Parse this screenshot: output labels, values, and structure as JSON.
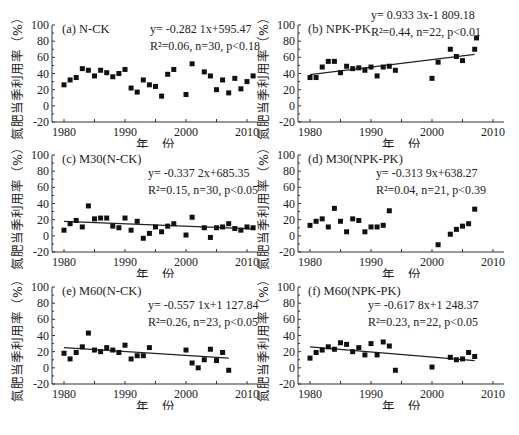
{
  "figure": {
    "ylabel": "氮肥当季利用率（%）",
    "xlabel": "年　份",
    "xticks": [
      "1980",
      "1990",
      "2000",
      "2010"
    ],
    "yticks": [
      "100",
      "80",
      "60",
      "40",
      "20",
      "0",
      "-20"
    ]
  },
  "chart_data": [
    {
      "type": "scatter",
      "title": "(a) N-CK",
      "equation": "y= -0.282 1x+595.47",
      "stats": "R²=0.06, n=30, p<0.18",
      "xlabel": "年 份",
      "ylabel": "氮肥当季利用率（%）",
      "xlim": [
        1979,
        2011
      ],
      "ylim": [
        -20,
        100
      ],
      "trendline": false,
      "x": [
        1980,
        1981,
        1982,
        1983,
        1984,
        1985,
        1986,
        1987,
        1988,
        1989,
        1990,
        1991,
        1992,
        1993,
        1994,
        1995,
        1996,
        1997,
        1998,
        2000,
        2001,
        2003,
        2004,
        2005,
        2006,
        2007,
        2008,
        2009,
        2010,
        2011
      ],
      "y": [
        26,
        32,
        35,
        46,
        44,
        37,
        44,
        41,
        36,
        40,
        45,
        22,
        17,
        32,
        26,
        24,
        12,
        39,
        45,
        14,
        52,
        42,
        37,
        20,
        32,
        16,
        34,
        21,
        30,
        37
      ]
    },
    {
      "type": "scatter",
      "title": "(b) NPK-PK",
      "equation": "y= 0.933 3x-1 809.18",
      "stats": "R²=0.44, n=22, p<0.01",
      "xlabel": "年 份",
      "ylabel": "氮肥当季利用率（%）",
      "xlim": [
        1979,
        2011
      ],
      "ylim": [
        -20,
        100
      ],
      "trendline": true,
      "trend": {
        "x0": 1980,
        "y0": 38.5,
        "x1": 2007,
        "y1": 63.7
      },
      "x": [
        1980,
        1981,
        1982,
        1983,
        1984,
        1985,
        1986,
        1987,
        1988,
        1989,
        1990,
        1991,
        1992,
        1993,
        1994,
        2000,
        2001,
        2003,
        2004,
        2005,
        2007,
        2007.3
      ],
      "y": [
        35,
        35,
        48,
        55,
        55,
        41,
        49,
        46,
        47,
        44,
        48,
        37,
        48,
        49,
        44,
        34,
        54,
        70,
        61,
        56,
        70,
        84
      ]
    },
    {
      "type": "scatter",
      "title": "(c) M30(N-CK)",
      "equation": "y= -0.337 2x+685.35",
      "stats": "R²=0.15, n=30, p<0.05",
      "xlabel": "年 份",
      "ylabel": "氮肥当季利用率（%）",
      "xlim": [
        1979,
        2011
      ],
      "ylim": [
        -20,
        100
      ],
      "trendline": true,
      "trend": {
        "x0": 1980,
        "y0": 18,
        "x1": 2011,
        "y1": 8.5
      },
      "x": [
        1980,
        1981,
        1982,
        1983,
        1984,
        1985,
        1986,
        1987,
        1988,
        1989,
        1990,
        1991,
        1992,
        1993,
        1994,
        1995,
        1996,
        1997,
        1998,
        2000,
        2001,
        2003,
        2004,
        2005,
        2006,
        2007,
        2008,
        2009,
        2010,
        2011
      ],
      "y": [
        7,
        15,
        19,
        11,
        37,
        21,
        22,
        22,
        12,
        10,
        22,
        7,
        18,
        -3,
        3,
        11,
        5,
        12,
        15,
        1,
        23,
        10,
        -2,
        10,
        11,
        15,
        9,
        7,
        11,
        10
      ]
    },
    {
      "type": "scatter",
      "title": "(d) M30(NPK-PK)",
      "equation": "y= -0.313 9x+638.27",
      "stats": "R²=0.04, n=21, p<0.39",
      "xlabel": "年 份",
      "ylabel": "氮肥当季利用率（%）",
      "xlim": [
        1979,
        2011
      ],
      "ylim": [
        -20,
        100
      ],
      "trendline": false,
      "x": [
        1980,
        1981,
        1982,
        1983,
        1984,
        1985,
        1986,
        1987,
        1988,
        1989,
        1990,
        1991,
        1992,
        1993,
        2001,
        2003,
        2004,
        2005,
        2006,
        2007
      ],
      "y": [
        13,
        18,
        21,
        11,
        34,
        18,
        5,
        21,
        19,
        5,
        11,
        11,
        13,
        31,
        -11,
        2,
        8,
        12,
        15,
        33
      ]
    },
    {
      "type": "scatter",
      "title": "(e) M60(N-CK)",
      "equation": "y= -0.557 1x+1 127.84",
      "stats": "R²=0.26, n=23, p<0.05",
      "xlabel": "年 份",
      "ylabel": "氮肥当季利用率（%）",
      "xlim": [
        1979,
        2011
      ],
      "ylim": [
        -20,
        100
      ],
      "trendline": true,
      "trend": {
        "x0": 1980,
        "y0": 25,
        "x1": 2007,
        "y1": 12
      },
      "x": [
        1980,
        1981,
        1982,
        1983,
        1984,
        1985,
        1986,
        1987,
        1988,
        1989,
        1990,
        1991,
        1992,
        1993,
        1994,
        2000,
        2001,
        2002,
        2003,
        2004,
        2005,
        2006,
        2007
      ],
      "y": [
        18,
        11,
        19,
        26,
        43,
        22,
        20,
        25,
        22,
        19,
        28,
        11,
        15,
        15,
        25,
        22,
        6,
        0,
        10,
        23,
        9,
        19,
        -3
      ]
    },
    {
      "type": "scatter",
      "title": "(f) M60(NPK-PK)",
      "equation": "y= -0.617 8x+1 248.37",
      "stats": "R²=0.23, n=22, p<0.05",
      "xlabel": "年 份",
      "ylabel": "氮肥当季利用率（%）",
      "xlim": [
        1979,
        2011
      ],
      "ylim": [
        -20,
        100
      ],
      "trendline": true,
      "trend": {
        "x0": 1980,
        "y0": 26,
        "x1": 2007,
        "y1": 9
      },
      "x": [
        1980,
        1981,
        1982,
        1983,
        1984,
        1985,
        1986,
        1987,
        1988,
        1989,
        1990,
        1991,
        1992,
        1993,
        1994,
        2000,
        2003,
        2004,
        2005,
        2006,
        2007
      ],
      "y": [
        12,
        19,
        22,
        26,
        23,
        31,
        29,
        20,
        25,
        16,
        30,
        16,
        32,
        27,
        -3,
        1,
        13,
        10,
        11,
        19,
        14
      ]
    }
  ]
}
